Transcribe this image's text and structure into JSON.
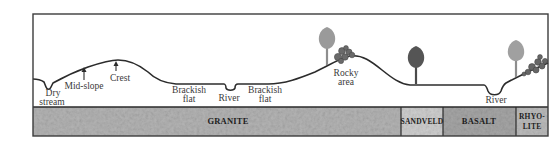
{
  "diagram": {
    "type": "landscape-cross-section",
    "frame": {
      "x": 33,
      "y": 14,
      "width": 515,
      "height": 122,
      "profile_panel_bottom": 107
    },
    "colors": {
      "frame": "#3c3c3c",
      "profile_line": "#2c2c2c",
      "label_text": "#3a3a3a",
      "tree_light": "#9a9a9a",
      "tree_dark": "#555555",
      "rocks": "#6a6a6a",
      "granite": "#b4b4b4",
      "sandveld": "#cfcfcf",
      "basalt": "#a6a6a6",
      "rhyolite": "#bcbcbc"
    },
    "landscape_labels": [
      {
        "id": "dry-stream",
        "lines": [
          "Dry",
          "stream"
        ],
        "x": 50,
        "y": 96
      },
      {
        "id": "mid-slope",
        "lines": [
          "Mid-slope"
        ],
        "x": 84,
        "y": 89
      },
      {
        "id": "crest",
        "lines": [
          "Crest"
        ],
        "x": 116,
        "y": 81
      },
      {
        "id": "brackish-flat-1",
        "lines": [
          "Brackish",
          "flat"
        ],
        "x": 188,
        "y": 94
      },
      {
        "id": "river-1",
        "lines": [
          "River"
        ],
        "x": 229,
        "y": 101
      },
      {
        "id": "brackish-flat-2",
        "lines": [
          "Brackish",
          "flat"
        ],
        "x": 265,
        "y": 94
      },
      {
        "id": "rocky-area",
        "lines": [
          "Rocky",
          "area"
        ],
        "x": 345,
        "y": 76
      },
      {
        "id": "river-2",
        "lines": [
          "River"
        ],
        "x": 498,
        "y": 103
      }
    ],
    "strata": [
      {
        "id": "granite",
        "label": "GRANITE",
        "x_start": 33,
        "x_end": 401
      },
      {
        "id": "sandveld",
        "label": "SANDVELD",
        "x_start": 401,
        "x_end": 443
      },
      {
        "id": "basalt",
        "label": "BASALT",
        "x_start": 443,
        "x_end": 516
      },
      {
        "id": "rhyolite",
        "label": "RHYO-\nLITE",
        "label_lines": [
          "RHYO-",
          "LITE"
        ],
        "x_start": 516,
        "x_end": 548
      }
    ],
    "features": {
      "trees": [
        {
          "id": "tree-rocky-area",
          "shade": "light",
          "x": 327,
          "base_y": 65
        },
        {
          "id": "tree-sandveld",
          "shade": "dark",
          "x": 416,
          "base_y": 84
        },
        {
          "id": "tree-rhyolite",
          "shade": "light",
          "x": 516,
          "base_y": 76
        }
      ],
      "rock_clusters": [
        {
          "id": "rocks-rocky-area",
          "x": 344,
          "y": 54
        },
        {
          "id": "rocks-rhyolite",
          "x": 537,
          "y": 64
        }
      ],
      "arrows": [
        {
          "id": "arrow-mid-slope",
          "x": 84,
          "y_tip": 67,
          "y_tail": 80
        },
        {
          "id": "arrow-crest",
          "x": 116,
          "y_tip": 61,
          "y_tail": 70
        }
      ]
    }
  }
}
